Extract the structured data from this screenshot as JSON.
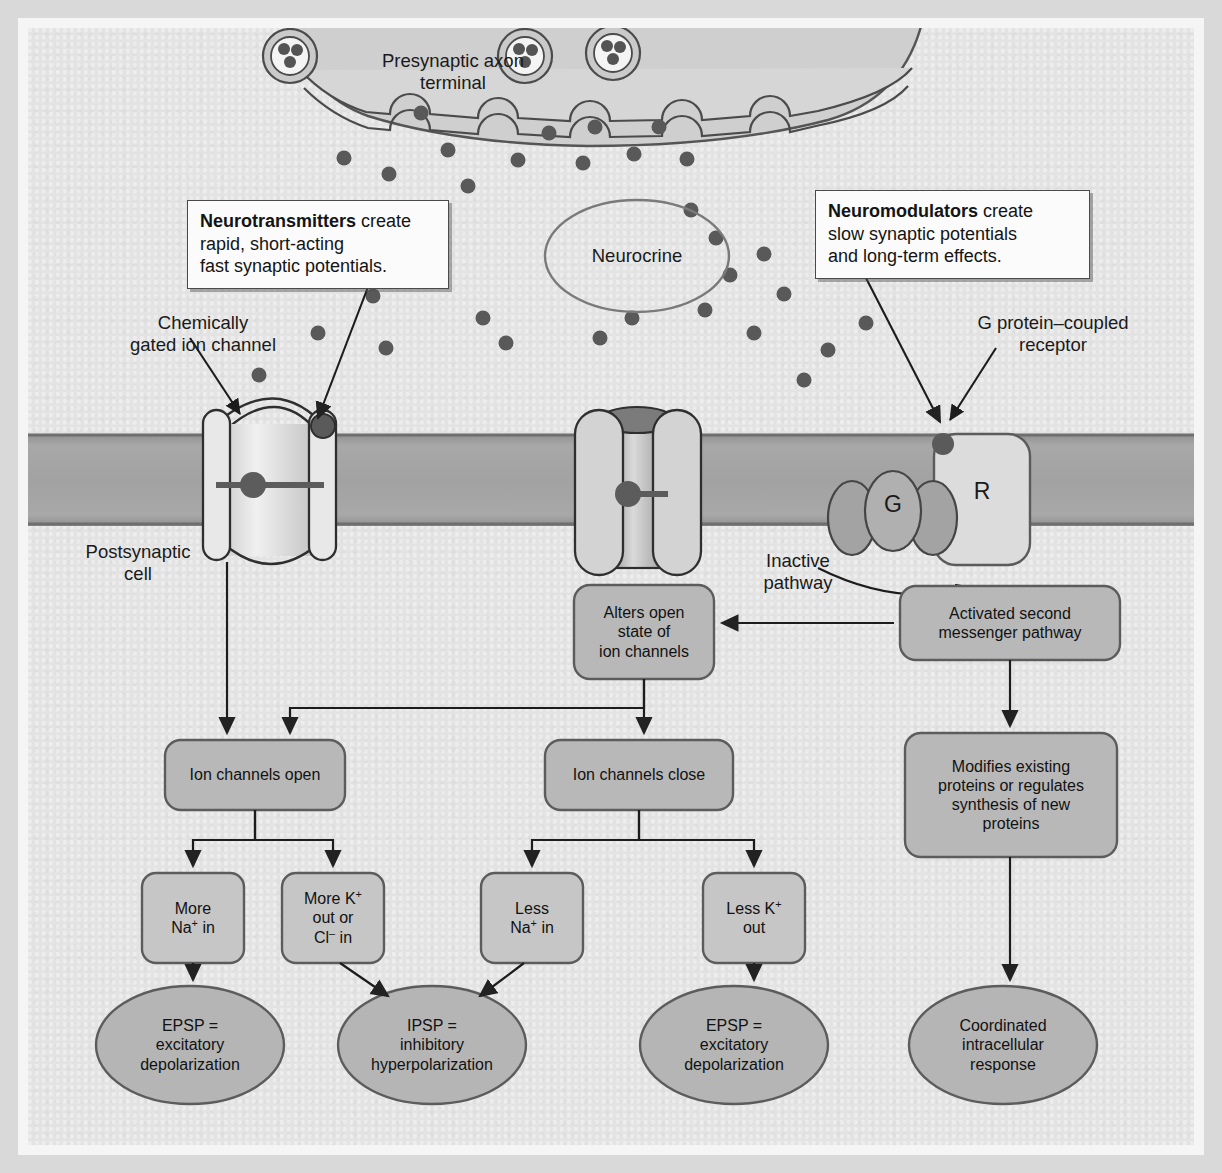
{
  "figure": {
    "colors": {
      "background": "#e3e3e3",
      "frame": "#f5f5f5",
      "membrane": "#9a9a9a",
      "box_fill": "#b8b8b8",
      "oval_fill": "#b5b5b5",
      "channel_fill": "#dcdcdc",
      "stroke": "#3a3a3a",
      "vesicle_dot": "#565656",
      "callout_fill": "#fbfbfb"
    }
  },
  "labels": {
    "presynaptic": "Presynaptic axon\nterminal",
    "presynaptic_line1": "Presynaptic axon",
    "presynaptic_line2": "terminal",
    "neurocrine": "Neurocrine",
    "chemically_gated_line1": "Chemically",
    "chemically_gated_line2": "gated ion channel",
    "gpcr_line1": "G protein–coupled",
    "gpcr_line2": "receptor",
    "postsynaptic_line1": "Postsynaptic",
    "postsynaptic_line2": "cell",
    "inactive_line1": "Inactive",
    "inactive_line2": "pathway",
    "receptor_symbol": "R",
    "gprotein_symbol": "G"
  },
  "callouts": [
    {
      "id": "neurotransmitters",
      "bold": "Neurotransmitters",
      "rest": " create",
      "line2": "rapid, short-acting",
      "line3": "fast synaptic potentials."
    },
    {
      "id": "neuromodulators",
      "bold": "Neuromodulators",
      "rest": " create",
      "line2": "slow synaptic potentials",
      "line3": "and long-term effects."
    }
  ],
  "flow": {
    "boxes": [
      {
        "id": "alters-open-state",
        "lines": [
          "Alters open",
          "state of",
          "ion channels"
        ]
      },
      {
        "id": "activated-second-messenger",
        "lines": [
          "Activated second",
          "messenger pathway"
        ]
      },
      {
        "id": "ion-channels-open",
        "lines": [
          "Ion channels open"
        ]
      },
      {
        "id": "ion-channels-close",
        "lines": [
          "Ion channels close"
        ]
      },
      {
        "id": "modifies-proteins",
        "lines": [
          "Modifies existing",
          "proteins or regulates",
          "synthesis of new",
          "proteins"
        ]
      }
    ],
    "ion_boxes": [
      {
        "id": "more-na-in",
        "line1": "More",
        "line2_pre": "Na",
        "line2_sup": "+",
        "line2_post": " in",
        "line3": ""
      },
      {
        "id": "more-k-out-or-cl-in",
        "line1_pre": "More K",
        "line1_sup": "+",
        "line2": "out or",
        "line3_pre": "Cl",
        "line3_sup": "–",
        "line3_post": " in"
      },
      {
        "id": "less-na-in",
        "line1": "Less",
        "line2_pre": "Na",
        "line2_sup": "+",
        "line2_post": " in"
      },
      {
        "id": "less-k-out",
        "line1_pre": "Less K",
        "line1_sup": "+",
        "line2": "out"
      }
    ],
    "outcomes": [
      {
        "id": "epsp-left",
        "lines": [
          "EPSP =",
          "excitatory",
          "depolarization"
        ]
      },
      {
        "id": "ipsp",
        "lines": [
          "IPSP =",
          "inhibitory",
          "hyperpolarization"
        ]
      },
      {
        "id": "epsp-right",
        "lines": [
          "EPSP =",
          "excitatory",
          "depolarization"
        ]
      },
      {
        "id": "coordinated-response",
        "lines": [
          "Coordinated",
          "intracellular",
          "response"
        ]
      }
    ]
  }
}
